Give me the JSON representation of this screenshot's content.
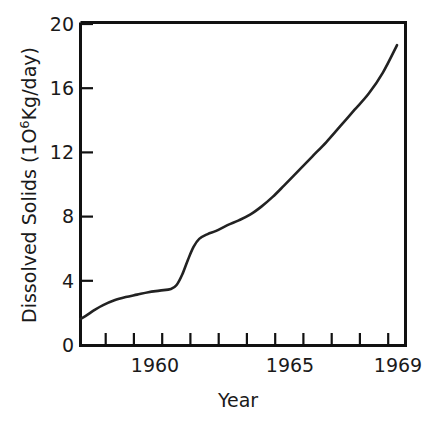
{
  "chart_data": {
    "type": "line",
    "title": "",
    "xlabel": "Year",
    "ylabel": "Dissolved Solids  (10⁶Kg/day)",
    "ylabel_parts": {
      "main": "Dissolved Solids  (1O",
      "superscript": "6",
      "tail": "Kg/day)"
    },
    "xlim": [
      1957.8,
      1969.3
    ],
    "ylim": [
      0,
      20
    ],
    "grid": false,
    "legend": null,
    "series": [
      {
        "name": "Dissolved Solids",
        "x": [
          1957.8,
          1958.0,
          1958.3,
          1958.6,
          1959.0,
          1959.4,
          1959.8,
          1960.2,
          1960.6,
          1961.0,
          1961.2,
          1961.4,
          1961.6,
          1961.8,
          1962.0,
          1962.3,
          1962.6,
          1963.0,
          1963.4,
          1963.8,
          1964.2,
          1964.6,
          1965.0,
          1965.5,
          1966.0,
          1966.5,
          1967.0,
          1967.5,
          1968.0,
          1968.5,
          1969.0
        ],
        "y": [
          1.65,
          1.85,
          2.2,
          2.5,
          2.8,
          3.0,
          3.15,
          3.3,
          3.4,
          3.5,
          3.75,
          4.4,
          5.3,
          6.1,
          6.6,
          6.9,
          7.1,
          7.45,
          7.75,
          8.1,
          8.6,
          9.2,
          9.9,
          10.8,
          11.7,
          12.6,
          13.6,
          14.6,
          15.6,
          16.9,
          18.6
        ]
      }
    ],
    "x_ticks": [
      {
        "value": 1958,
        "label": ""
      },
      {
        "value": 1959,
        "label": ""
      },
      {
        "value": 1960,
        "label": "1960"
      },
      {
        "value": 1961,
        "label": ""
      },
      {
        "value": 1962,
        "label": ""
      },
      {
        "value": 1963,
        "label": ""
      },
      {
        "value": 1964,
        "label": ""
      },
      {
        "value": 1965,
        "label": "1965"
      },
      {
        "value": 1966,
        "label": ""
      },
      {
        "value": 1967,
        "label": ""
      },
      {
        "value": 1968,
        "label": ""
      },
      {
        "value": 1969,
        "label": "1969"
      }
    ],
    "y_ticks": [
      {
        "value": 0,
        "label": "0"
      },
      {
        "value": 4,
        "label": "4"
      },
      {
        "value": 8,
        "label": "8"
      },
      {
        "value": 12,
        "label": "12"
      },
      {
        "value": 16,
        "label": "16"
      },
      {
        "value": 20,
        "label": "20"
      }
    ],
    "colors": {
      "background": "#ffffff",
      "line": "#222222",
      "axis": "#111111",
      "text": "#1a1a1a"
    },
    "annotations": []
  },
  "labels": {
    "y_axis_title_main": "Dissolved Solids  (1O",
    "y_axis_title_sup": "6",
    "y_axis_title_tail": "Kg/day)",
    "x_axis_title": "Year",
    "y_tick_20": "20",
    "y_tick_16": "16",
    "y_tick_12": "12",
    "y_tick_8": "8",
    "y_tick_4": "4",
    "y_tick_0": "0",
    "x_tick_1960": "1960",
    "x_tick_1965": "1965",
    "x_tick_1969": "1969"
  }
}
